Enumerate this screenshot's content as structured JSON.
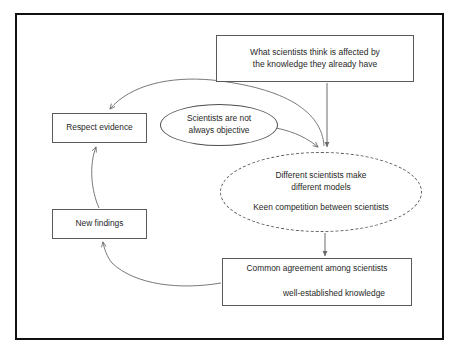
{
  "diagram": {
    "frame": {
      "border_color": "#111111",
      "background": "#ffffff"
    },
    "nodes": [
      {
        "id": "knowledge-affects",
        "shape": "rectangle",
        "text": "What scientists think is affected by\nthe knowledge they already have"
      },
      {
        "id": "respect-evidence",
        "shape": "rectangle",
        "text": "Respect evidence"
      },
      {
        "id": "new-findings",
        "shape": "rectangle",
        "text": "New findings"
      },
      {
        "id": "not-objective",
        "shape": "ellipse",
        "text": "Scientists are not\nalways objective"
      },
      {
        "id": "different-models",
        "shape": "ellipse-dashed",
        "line_one": "Different scientists make\ndifferent models",
        "line_two": "Keen competition between scientists"
      },
      {
        "id": "common-agreement",
        "shape": "rectangle",
        "line_one": "Common agreement among scientists",
        "line_two": "well-established knowledge"
      }
    ],
    "connectors": [
      {
        "id": "knowledge-affects-to-models",
        "from": "knowledge-affects",
        "to": "different-models",
        "style": "straight-arrow"
      },
      {
        "id": "not-objective-to-models",
        "from": "not-objective",
        "to": "different-models",
        "style": "curved-arrow"
      },
      {
        "id": "models-to-common-agreement",
        "from": "different-models",
        "to": "common-agreement",
        "style": "straight-arrow"
      },
      {
        "id": "common-agreement-to-new-findings",
        "from": "common-agreement",
        "to": "new-findings",
        "style": "curved-arrow"
      },
      {
        "id": "new-findings-to-respect-evidence",
        "from": "new-findings",
        "to": "respect-evidence",
        "style": "curved-arrow"
      },
      {
        "id": "models-to-respect-evidence",
        "from": "different-models",
        "to": "respect-evidence",
        "style": "long-curved-arrow"
      },
      {
        "id": "agreement-leads-to-knowledge",
        "from": "common-agreement-line-one",
        "to": "common-agreement-line-two",
        "style": "elbow-arrow"
      }
    ],
    "colors": {
      "frame": "#111111",
      "node_stroke": "#5a5a5a",
      "connector_stroke": "#6a6a6a",
      "text": "#1f1f1f"
    }
  }
}
